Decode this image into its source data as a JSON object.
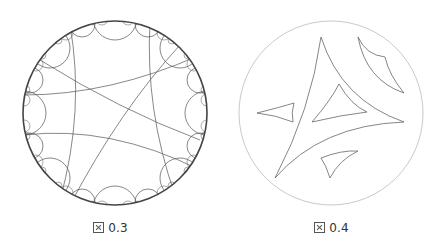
{
  "figures": [
    {
      "id": "fig-0-3",
      "caption": "0.3",
      "caption_prefix": "図",
      "description": "Hyperbolic tessellation in Poincaré disk (right-angled pentagons/quadrilaterals)",
      "disk": {
        "cx": 115,
        "cy": 113,
        "r": 92
      },
      "stroke_color": "#555555"
    },
    {
      "id": "fig-0-4",
      "caption": "0.4",
      "caption_prefix": "図",
      "description": "Hyperbolic ideal triangles and regions in Poincaré disk",
      "disk": {
        "cx": 110,
        "cy": 113,
        "r": 92
      },
      "stroke_color": "#666666",
      "disk_color": "#bbbbbb"
    }
  ]
}
